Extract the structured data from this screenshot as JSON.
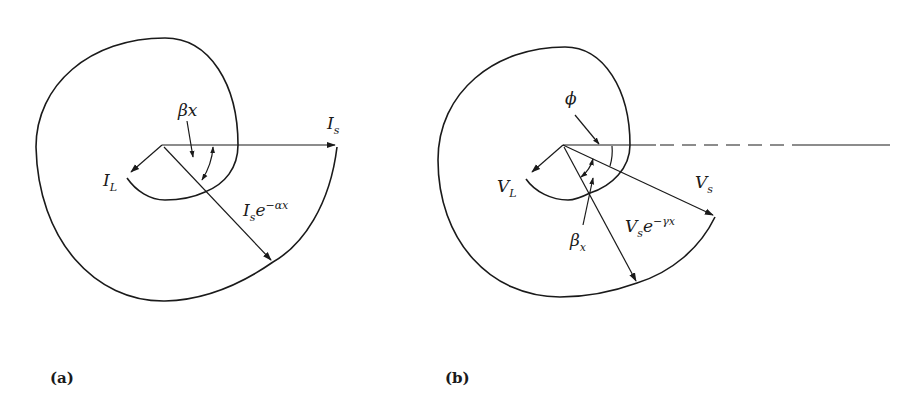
{
  "figure": {
    "panel_a": {
      "caption": "(a)",
      "labels": {
        "beta_x": "βx",
        "I_s_main": "I",
        "I_s_sub": "s",
        "I_L_main": "I",
        "I_L_sub": "L",
        "I_s_decay_main": "I",
        "I_s_decay_sub": "s",
        "I_s_decay_e": "e",
        "I_s_decay_exp": "−αx"
      },
      "description": "Spiral phasor locus of current along a line: sending current I_s decays as I_s e^(-αx) while rotating by angle βx to load current I_L"
    },
    "panel_b": {
      "caption": "(b)",
      "labels": {
        "phi": "ϕ",
        "beta_main": "β",
        "beta_sub": "x",
        "V_s_main": "V",
        "V_s_sub": "s",
        "V_L_main": "V",
        "V_L_sub": "L",
        "V_s_decay_main": "V",
        "V_s_decay_sub": "s",
        "V_s_decay_e": "e",
        "V_s_decay_exp": "−γx"
      },
      "description": "Spiral phasor locus of voltage: sending voltage V_s at angle ϕ below reference decays as V_s e^(-γx) while rotating by βx to load voltage V_L"
    },
    "colors": {
      "ink": "#1a1a1a",
      "background": "#ffffff"
    }
  }
}
